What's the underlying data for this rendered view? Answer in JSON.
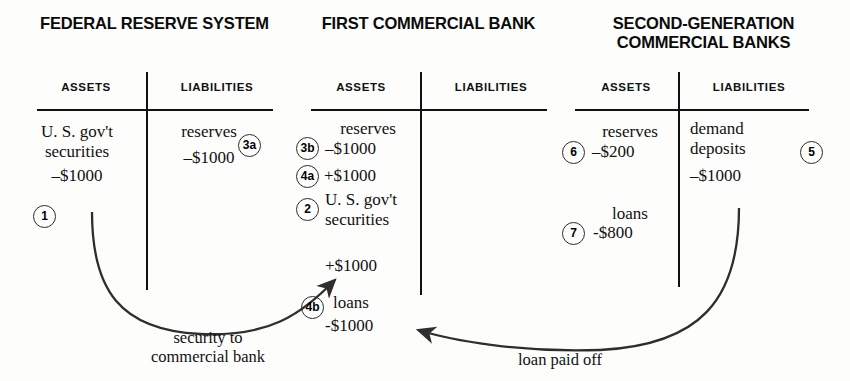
{
  "figure": {
    "accounts": [
      {
        "title": "FEDERAL RESERVE\nSYSTEM",
        "assets_header": "ASSETS",
        "liabilities_header": "LIABILITIES",
        "asset_entries": [
          {
            "label": "U. S. gov't\nsecurities",
            "amount": "–$1000",
            "marker": "1"
          }
        ],
        "liability_entries": [
          {
            "label": "reserves",
            "amount": "–$1000",
            "marker": "3a"
          }
        ]
      },
      {
        "title": "FIRST\nCOMMERCIAL BANK",
        "assets_header": "ASSETS",
        "liabilities_header": "LIABILITIES",
        "asset_entries": [
          {
            "label": "reserves",
            "amount": "–$1000",
            "marker": "3b"
          },
          {
            "label": "",
            "amount": "+$1000",
            "marker": "4a"
          },
          {
            "label": "U. S. gov't\nsecurities",
            "amount": "+$1000",
            "marker": "2"
          },
          {
            "label": "loans",
            "amount": "-$1000",
            "marker": "4b"
          }
        ],
        "liability_entries": []
      },
      {
        "title": "SECOND-GENERATION\nCOMMERCIAL BANKS",
        "assets_header": "ASSETS",
        "liabilities_header": "LIABILITIES",
        "asset_entries": [
          {
            "label": "reserves",
            "amount": "–$200",
            "marker": "6"
          },
          {
            "label": "loans",
            "amount": "-$800",
            "marker": "7"
          }
        ],
        "liability_entries": [
          {
            "label": "demand\ndeposits",
            "amount": "–$1000",
            "marker": "5"
          }
        ]
      }
    ],
    "flow_labels": {
      "security_to_bank": "security to\ncommercial bank",
      "loan_paid_off": "loan paid off"
    },
    "colors": {
      "ink": "#111111",
      "background": "#fdfdfc",
      "marker_stroke": "#2b2b2b"
    }
  }
}
